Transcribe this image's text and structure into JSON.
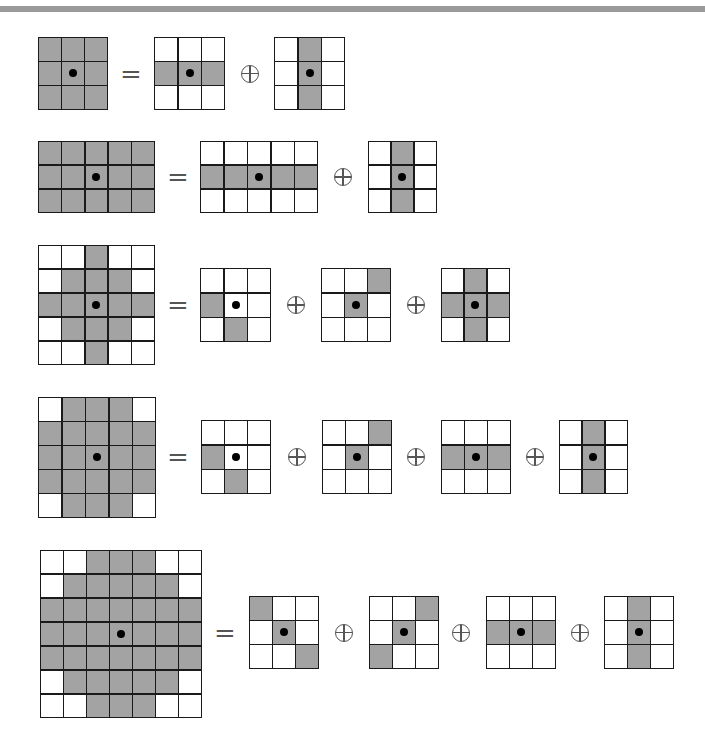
{
  "symbols": {
    "equals": "=",
    "oplus": "⊕"
  },
  "colors": {
    "filled": "#a3a3a3",
    "empty": "#ffffff",
    "grid_line": "#1a1a1a",
    "origin_dot": "#000000",
    "top_bar": "#9a9a9a"
  },
  "rows": [
    {
      "lhs": {
        "x": 38,
        "y": 37,
        "w": 70,
        "h": 73,
        "cells": [
          [
            1,
            1,
            1
          ],
          [
            1,
            1,
            1
          ],
          [
            1,
            1,
            1
          ]
        ],
        "origin": [
          1,
          1
        ]
      },
      "equals_x": 131,
      "terms": [
        {
          "x": 154,
          "y": 37,
          "w": 71,
          "h": 73,
          "cells": [
            [
              0,
              0,
              0
            ],
            [
              1,
              1,
              1
            ],
            [
              0,
              0,
              0
            ]
          ],
          "origin": [
            1,
            1
          ]
        },
        {
          "x": 274,
          "y": 37,
          "w": 71,
          "h": 73,
          "cells": [
            [
              0,
              1,
              0
            ],
            [
              0,
              1,
              0
            ],
            [
              0,
              1,
              0
            ]
          ],
          "origin": [
            1,
            1
          ]
        }
      ],
      "oplus_x": [
        250
      ]
    },
    {
      "lhs": {
        "x": 38,
        "y": 141,
        "w": 117,
        "h": 72,
        "cells": [
          [
            1,
            1,
            1,
            1,
            1
          ],
          [
            1,
            1,
            1,
            1,
            1
          ],
          [
            1,
            1,
            1,
            1,
            1
          ]
        ],
        "origin": [
          1,
          2
        ]
      },
      "equals_x": 178,
      "terms": [
        {
          "x": 200,
          "y": 141,
          "w": 118,
          "h": 72,
          "cells": [
            [
              0,
              0,
              0,
              0,
              0
            ],
            [
              1,
              1,
              1,
              1,
              1
            ],
            [
              0,
              0,
              0,
              0,
              0
            ]
          ],
          "origin": [
            1,
            2
          ]
        },
        {
          "x": 368,
          "y": 141,
          "w": 69,
          "h": 72,
          "cells": [
            [
              0,
              1,
              0
            ],
            [
              0,
              1,
              0
            ],
            [
              0,
              1,
              0
            ]
          ],
          "origin": [
            1,
            1
          ]
        }
      ],
      "oplus_x": [
        343
      ]
    },
    {
      "lhs": {
        "x": 38,
        "y": 245,
        "w": 117,
        "h": 120,
        "cells": [
          [
            0,
            0,
            1,
            0,
            0
          ],
          [
            0,
            1,
            1,
            1,
            0
          ],
          [
            1,
            1,
            1,
            1,
            1
          ],
          [
            0,
            1,
            1,
            1,
            0
          ],
          [
            0,
            0,
            1,
            0,
            0
          ]
        ],
        "origin": [
          2,
          2
        ]
      },
      "equals_x": 178,
      "terms": [
        {
          "x": 200,
          "y": 268,
          "w": 71,
          "h": 74,
          "cells": [
            [
              0,
              0,
              0
            ],
            [
              1,
              0,
              0
            ],
            [
              0,
              1,
              0
            ]
          ],
          "origin": [
            1,
            1
          ]
        },
        {
          "x": 321,
          "y": 268,
          "w": 70,
          "h": 74,
          "cells": [
            [
              0,
              0,
              1
            ],
            [
              0,
              1,
              0
            ],
            [
              0,
              0,
              0
            ]
          ],
          "origin": [
            1,
            1
          ]
        },
        {
          "x": 441,
          "y": 268,
          "w": 69,
          "h": 74,
          "cells": [
            [
              0,
              1,
              0
            ],
            [
              1,
              1,
              1
            ],
            [
              0,
              1,
              0
            ]
          ],
          "origin": [
            1,
            1
          ]
        }
      ],
      "oplus_x": [
        296,
        416
      ]
    },
    {
      "lhs": {
        "x": 38,
        "y": 397,
        "w": 118,
        "h": 121,
        "cells": [
          [
            0,
            1,
            1,
            1,
            0
          ],
          [
            1,
            1,
            1,
            1,
            1
          ],
          [
            1,
            1,
            1,
            1,
            1
          ],
          [
            1,
            1,
            1,
            1,
            1
          ],
          [
            0,
            1,
            1,
            1,
            0
          ]
        ],
        "origin": [
          2,
          2
        ]
      },
      "equals_x": 178,
      "terms": [
        {
          "x": 201,
          "y": 420,
          "w": 70,
          "h": 74,
          "cells": [
            [
              0,
              0,
              0
            ],
            [
              1,
              0,
              0
            ],
            [
              0,
              1,
              0
            ]
          ],
          "origin": [
            1,
            1
          ]
        },
        {
          "x": 322,
          "y": 420,
          "w": 70,
          "h": 74,
          "cells": [
            [
              0,
              0,
              1
            ],
            [
              0,
              1,
              0
            ],
            [
              0,
              0,
              0
            ]
          ],
          "origin": [
            1,
            1
          ]
        },
        {
          "x": 441,
          "y": 420,
          "w": 70,
          "h": 74,
          "cells": [
            [
              0,
              0,
              0
            ],
            [
              1,
              1,
              1
            ],
            [
              0,
              0,
              0
            ]
          ],
          "origin": [
            1,
            1
          ]
        },
        {
          "x": 559,
          "y": 420,
          "w": 69,
          "h": 74,
          "cells": [
            [
              0,
              1,
              0
            ],
            [
              0,
              1,
              0
            ],
            [
              0,
              1,
              0
            ]
          ],
          "origin": [
            1,
            1
          ]
        }
      ],
      "oplus_x": [
        297,
        416,
        535
      ]
    },
    {
      "lhs": {
        "x": 40,
        "y": 550,
        "w": 162,
        "h": 168,
        "cells": [
          [
            0,
            0,
            1,
            1,
            1,
            0,
            0
          ],
          [
            0,
            1,
            1,
            1,
            1,
            1,
            0
          ],
          [
            1,
            1,
            1,
            1,
            1,
            1,
            1
          ],
          [
            1,
            1,
            1,
            1,
            1,
            1,
            1
          ],
          [
            1,
            1,
            1,
            1,
            1,
            1,
            1
          ],
          [
            0,
            1,
            1,
            1,
            1,
            1,
            0
          ],
          [
            0,
            0,
            1,
            1,
            1,
            0,
            0
          ]
        ],
        "origin": [
          3,
          3
        ]
      },
      "equals_x": 225,
      "terms": [
        {
          "x": 249,
          "y": 596,
          "w": 70,
          "h": 73,
          "cells": [
            [
              1,
              0,
              0
            ],
            [
              0,
              1,
              0
            ],
            [
              0,
              0,
              1
            ]
          ],
          "origin": [
            1,
            1
          ]
        },
        {
          "x": 369,
          "y": 596,
          "w": 70,
          "h": 73,
          "cells": [
            [
              0,
              0,
              1
            ],
            [
              0,
              1,
              0
            ],
            [
              1,
              0,
              0
            ]
          ],
          "origin": [
            1,
            1
          ]
        },
        {
          "x": 486,
          "y": 596,
          "w": 70,
          "h": 73,
          "cells": [
            [
              0,
              0,
              0
            ],
            [
              1,
              1,
              1
            ],
            [
              0,
              0,
              0
            ]
          ],
          "origin": [
            1,
            1
          ]
        },
        {
          "x": 604,
          "y": 596,
          "w": 70,
          "h": 73,
          "cells": [
            [
              0,
              1,
              0
            ],
            [
              0,
              1,
              0
            ],
            [
              0,
              1,
              0
            ]
          ],
          "origin": [
            1,
            1
          ]
        }
      ],
      "oplus_x": [
        344,
        461,
        580
      ]
    }
  ]
}
